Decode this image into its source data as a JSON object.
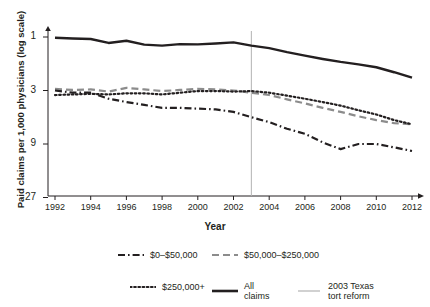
{
  "chart_data": {
    "type": "line",
    "title": "",
    "xlabel": "Year",
    "ylabel": "Paid claims per 1,000 physicians (log scale)",
    "yscale": "log",
    "xlim": [
      1991.5,
      2012.5
    ],
    "ylim": [
      1,
      30
    ],
    "yticks": [
      1,
      3,
      9,
      27
    ],
    "ytick_labels": [
      "1",
      "3",
      "9",
      "27"
    ],
    "xticks": [
      1992,
      1994,
      1996,
      1998,
      2000,
      2002,
      2004,
      2006,
      2008,
      2010,
      2012
    ],
    "xtick_labels": [
      "1992",
      "1994",
      "1996",
      "1998",
      "2000",
      "2002",
      "2004",
      "2006",
      "2008",
      "2010",
      "2012"
    ],
    "grid": false,
    "legend_position": "below",
    "x": [
      1992,
      1993,
      1994,
      1995,
      1996,
      1997,
      1998,
      1999,
      2000,
      2001,
      2002,
      2003,
      2004,
      2005,
      2006,
      2007,
      2008,
      2009,
      2010,
      2011,
      2012
    ],
    "series": [
      {
        "name": "All claims",
        "style": "solid",
        "color": "#231f20",
        "values": [
          26.6,
          26.2,
          25.9,
          23.9,
          25.0,
          23.1,
          22.6,
          23.3,
          23.2,
          23.6,
          24.2,
          22.6,
          21.5,
          19.8,
          18.4,
          17.2,
          16.2,
          15.4,
          14.5,
          13.1,
          11.7
        ]
      },
      {
        "name": "$50,000–$250,000",
        "style": "dashed",
        "color": "#8c8c8c",
        "values": [
          9.3,
          9.1,
          9.2,
          8.8,
          9.5,
          9.2,
          8.9,
          9.1,
          9.3,
          9.2,
          9.0,
          8.6,
          8.2,
          7.5,
          6.9,
          6.3,
          5.8,
          5.3,
          4.9,
          4.6,
          4.5
        ]
      },
      {
        "name": "$250,000+",
        "style": "dotted",
        "color": "#231f20",
        "values": [
          8.2,
          8.3,
          8.4,
          8.3,
          8.5,
          8.5,
          8.3,
          8.6,
          8.9,
          8.9,
          8.8,
          8.9,
          8.6,
          8.1,
          7.6,
          7.1,
          6.6,
          6.0,
          5.5,
          4.9,
          4.5
        ]
      },
      {
        "name": "$0–$50,000",
        "style": "dashdot",
        "color": "#231f20",
        "values": [
          9.0,
          8.6,
          8.6,
          7.6,
          7.1,
          6.7,
          6.3,
          6.3,
          6.2,
          6.1,
          5.8,
          5.2,
          4.7,
          4.1,
          3.7,
          3.1,
          2.7,
          3.0,
          3.0,
          2.8,
          2.6
        ]
      }
    ],
    "annotations": [
      {
        "name": "2003 Texas tort reform",
        "type": "vline",
        "x": 2003,
        "color": "#b3b3b3"
      }
    ]
  },
  "axes": {
    "y_title": "Paid claims per 1,000 physicians (log scale)",
    "x_title": "Year",
    "y_tick_labels": [
      "27",
      "9",
      "3",
      "1"
    ],
    "x_tick_labels": [
      "1992",
      "1994",
      "1996",
      "1998",
      "2000",
      "2002",
      "2004",
      "2006",
      "2008",
      "2010",
      "2012"
    ]
  },
  "legend": {
    "items": [
      {
        "label": "$0–$50,000",
        "style": "dashdot",
        "color": "#231f20"
      },
      {
        "label": "$50,000–$250,000",
        "style": "dashed",
        "color": "#8c8c8c"
      },
      {
        "label": "$250,000+",
        "style": "dotted",
        "color": "#231f20"
      },
      {
        "label": "All claims",
        "label_line1": "All",
        "label_line2": "claims",
        "style": "solid",
        "color": "#231f20"
      },
      {
        "label": "2003 Texas tort reform",
        "label_line1": "2003 Texas",
        "label_line2": "tort reform",
        "style": "vline",
        "color": "#b3b3b3"
      }
    ]
  }
}
